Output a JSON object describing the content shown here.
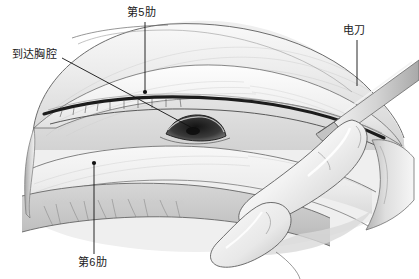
{
  "figure": {
    "width": 419,
    "height": 279,
    "background_color": "#ffffff",
    "style": "grayscale medical line illustration"
  },
  "annotations": [
    {
      "id": "rib5",
      "label": "第5肋",
      "meaning": "fifth rib",
      "label_x": 127,
      "label_y": 6,
      "leader": {
        "x1": 145,
        "y1": 22,
        "x2": 145,
        "y2": 92,
        "dot_x": 145,
        "dot_y": 92
      }
    },
    {
      "id": "pleura",
      "label": "到达胸腔",
      "meaning": "reaching the thoracic cavity",
      "label_x": 12,
      "label_y": 48,
      "leader": {
        "x1": 62,
        "y1": 58,
        "x2": 196,
        "y2": 130,
        "dot_x": 196,
        "dot_y": 130
      }
    },
    {
      "id": "cautery",
      "label": "电刀",
      "meaning": "electrocautery pencil",
      "label_x": 343,
      "label_y": 24,
      "leader": {
        "x1": 357,
        "y1": 40,
        "x2": 357,
        "y2": 86,
        "dot_x": 357,
        "dot_y": 86
      }
    },
    {
      "id": "rib6",
      "label": "第6肋",
      "meaning": "sixth rib",
      "label_x": 78,
      "label_y": 256,
      "leader": {
        "x1": 94,
        "y1": 254,
        "x2": 94,
        "y2": 163,
        "dot_x": 94,
        "dot_y": 163
      }
    }
  ],
  "colors": {
    "ink": "#1a1a1a",
    "leader": "#111111",
    "tissue_light": "#f4f4f4",
    "tissue_mid": "#dcdcdc",
    "tissue_shadow": "#b8b8b8",
    "tissue_dark": "#8e8e8e",
    "muscle_band": "#c9c9c9",
    "incision_dark": "#1c1c1c",
    "cavity_dark": "#2b2b2b",
    "glove_light": "#fbfbfb",
    "instrument_gray": "#cfcfcf"
  },
  "elements": {
    "incision_line": "dark horizontal intercostal incision across mid-field",
    "cavity_opening": "dark oval opening into thoracic cavity at center",
    "cautery_tip": "pointed electrocautery blade angled down-left",
    "finger": "gloved index finger inserted into incision from lower right",
    "muscle_striation_band": "textured muscle band along lower left margin"
  }
}
